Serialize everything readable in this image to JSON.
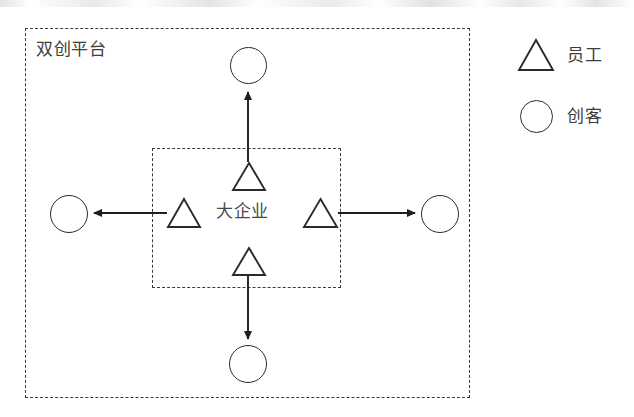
{
  "diagram": {
    "outer_container": {
      "label": "双创平台",
      "border_style": "dashed",
      "color": "#3a3a3a"
    },
    "inner_container": {
      "label": "大企业",
      "border_style": "dashed",
      "color": "#3a3a3a"
    },
    "nodes": [
      {
        "id": "employee-top",
        "shape": "triangle",
        "role": "员工",
        "position": "top-inner"
      },
      {
        "id": "employee-left",
        "shape": "triangle",
        "role": "员工",
        "position": "left-inner"
      },
      {
        "id": "employee-right",
        "shape": "triangle",
        "role": "员工",
        "position": "right-inner"
      },
      {
        "id": "employee-bottom",
        "shape": "triangle",
        "role": "员工",
        "position": "bottom-inner"
      },
      {
        "id": "maker-top",
        "shape": "circle",
        "role": "创客",
        "position": "top-outer"
      },
      {
        "id": "maker-left",
        "shape": "circle",
        "role": "创客",
        "position": "left-outer"
      },
      {
        "id": "maker-right",
        "shape": "circle",
        "role": "创客",
        "position": "right-outer"
      },
      {
        "id": "maker-bottom",
        "shape": "circle",
        "role": "创客",
        "position": "bottom-outer"
      }
    ],
    "arrows": [
      {
        "id": "arrow-up",
        "from": "employee-top",
        "to": "maker-top",
        "direction": "up"
      },
      {
        "id": "arrow-left",
        "from": "employee-left",
        "to": "maker-left",
        "direction": "left"
      },
      {
        "id": "arrow-right",
        "from": "employee-right",
        "to": "maker-right",
        "direction": "right"
      },
      {
        "id": "arrow-down",
        "from": "employee-bottom",
        "to": "maker-bottom",
        "direction": "down"
      }
    ]
  },
  "legend": {
    "items": [
      {
        "symbol": "triangle",
        "label": "员工"
      },
      {
        "symbol": "circle",
        "label": "创客"
      }
    ]
  },
  "colors": {
    "stroke": "#2b2b2b",
    "dashed_border": "#3a3a3a",
    "text": "#3d3d3d",
    "background": "#ffffff"
  }
}
